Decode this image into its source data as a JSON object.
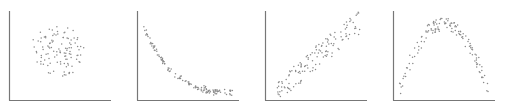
{
  "chart_data": [
    {
      "type": "scatter",
      "title": "",
      "xlabel": "",
      "ylabel": "",
      "pattern": "no correlation (circular cloud)",
      "xlim": [
        0,
        10
      ],
      "ylim": [
        0,
        10
      ],
      "grid": false,
      "center": [
        4.5,
        4.5
      ],
      "radius": 3.2,
      "n_points": 110
    },
    {
      "type": "scatter",
      "title": "",
      "xlabel": "",
      "ylabel": "",
      "pattern": "negative nonlinear (exponential decay)",
      "xlim": [
        0,
        10
      ],
      "ylim": [
        0,
        10
      ],
      "grid": false,
      "x": [
        0.5,
        1,
        1.5,
        2,
        2.5,
        3,
        3.5,
        4,
        5,
        6,
        7,
        8,
        9,
        9.5
      ],
      "y": [
        8.5,
        7.2,
        6.1,
        5.2,
        4.4,
        3.7,
        3.1,
        2.6,
        1.9,
        1.4,
        1.1,
        0.9,
        0.8,
        0.8
      ],
      "n_points": 130
    },
    {
      "type": "scatter",
      "title": "",
      "xlabel": "",
      "ylabel": "",
      "pattern": "strong positive linear",
      "xlim": [
        0,
        10
      ],
      "ylim": [
        0,
        10
      ],
      "grid": false,
      "x": [
        1,
        9.5
      ],
      "y": [
        1,
        9
      ],
      "band_width": 1.4,
      "n_points": 130
    },
    {
      "type": "scatter",
      "title": "",
      "xlabel": "",
      "ylabel": "",
      "pattern": "inverted-U (quadratic)",
      "xlim": [
        0,
        10
      ],
      "ylim": [
        0,
        10
      ],
      "grid": false,
      "x": [
        0.5,
        2,
        3.5,
        5,
        6.5,
        8,
        9.5
      ],
      "y": [
        1.0,
        5.2,
        8.0,
        8.8,
        8.0,
        5.2,
        1.0
      ],
      "n_points": 130
    }
  ],
  "colors": {
    "axis": "#777777",
    "dot": "#8a8a8a",
    "background": "#ffffff"
  }
}
